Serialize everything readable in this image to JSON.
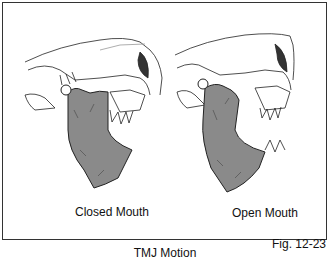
{
  "figure": {
    "panels": [
      {
        "label": "Closed Mouth",
        "state": "closed"
      },
      {
        "label": "Open Mouth",
        "state": "open"
      }
    ],
    "title": "TMJ Motion",
    "figure_number": "Fig. 12-23",
    "colors": {
      "mandible_fill": "#8a8a8a",
      "line": "#222222",
      "border": "#333333"
    }
  }
}
